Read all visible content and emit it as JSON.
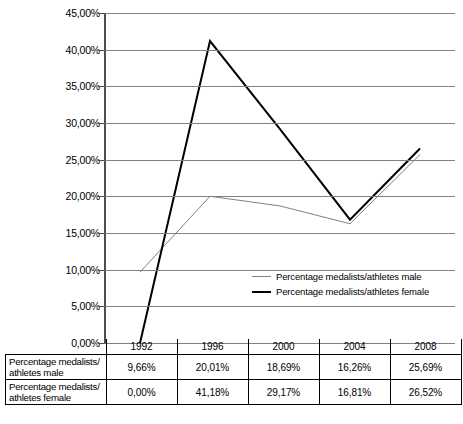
{
  "chart_data": {
    "type": "line",
    "title": "",
    "xlabel": "",
    "ylabel": "",
    "categories": [
      "1992",
      "1996",
      "2000",
      "2004",
      "2008"
    ],
    "ylim": [
      0,
      45
    ],
    "y_tick_labels": [
      "45,00%",
      "40,00%",
      "35,00%",
      "30,00%",
      "25,00%",
      "20,00%",
      "15,00%",
      "10,00%",
      "5,00%",
      "0,00%"
    ],
    "y_tick_values": [
      45,
      40,
      35,
      30,
      25,
      20,
      15,
      10,
      5,
      0
    ],
    "grid": true,
    "legend_position": "inside-bottom-right",
    "series": [
      {
        "name": "Percentage medalists/athletes male",
        "values": [
          9.66,
          20.01,
          18.69,
          16.26,
          25.69
        ],
        "labels": [
          "9,66%",
          "20,01%",
          "18,69%",
          "16,26%",
          "25,69%"
        ],
        "color": "#808080",
        "width": 1
      },
      {
        "name": "Percentage medalists/athletes female",
        "values": [
          0.0,
          41.18,
          29.17,
          16.81,
          26.52
        ],
        "labels": [
          "0,00%",
          "41,18%",
          "29,17%",
          "16,81%",
          "26,52%"
        ],
        "color": "#000000",
        "width": 2
      }
    ]
  },
  "legend": {
    "items": [
      {
        "label": "Percentage medalists/athletes male"
      },
      {
        "label": "Percentage medalists/athletes female"
      }
    ]
  },
  "table": {
    "corner": "",
    "columns": [
      "1992",
      "1996",
      "2000",
      "2004",
      "2008"
    ],
    "rows": [
      {
        "label": "Percentage medalists/\nathletes male",
        "label_line1": "Percentage medalists/",
        "label_line2": "athletes male",
        "values": [
          "9,66%",
          "20,01%",
          "18,69%",
          "16,26%",
          "25,69%"
        ]
      },
      {
        "label": "Percentage medalists/\nathletes female",
        "label_line1": "Percentage medalists/",
        "label_line2": "athletes female",
        "values": [
          "0,00%",
          "41,18%",
          "29,17%",
          "16,81%",
          "26,52%"
        ]
      }
    ]
  },
  "colors": {
    "male_line": "#808080",
    "female_line": "#000000",
    "gridline": "#808080",
    "axis": "#4d4d4d",
    "background": "#ffffff"
  }
}
